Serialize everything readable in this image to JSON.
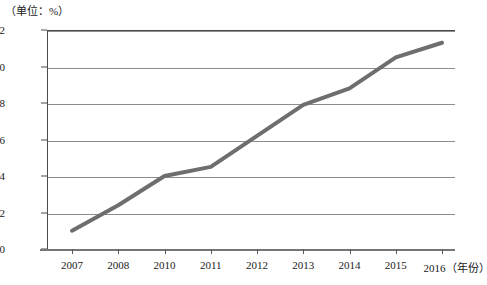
{
  "chart_data": {
    "type": "line",
    "title": "",
    "unit_note": "（单位：%）",
    "xlabel": "（年份）",
    "ylabel": "",
    "categories": [
      "2007",
      "2008",
      "2010",
      "2011",
      "2012",
      "2013",
      "2014",
      "2015",
      "2016"
    ],
    "values": [
      0.01,
      0.024,
      0.04,
      0.045,
      0.062,
      0.079,
      0.088,
      0.105,
      0.113
    ],
    "series": [
      {
        "name": "",
        "values": [
          0.01,
          0.024,
          0.04,
          0.045,
          0.062,
          0.079,
          0.088,
          0.105,
          0.113
        ]
      }
    ],
    "ylim": [
      0,
      0.12
    ],
    "yticks": [
      "0",
      "0.02",
      "0.04",
      "0.06",
      "0.08",
      "0.10",
      "0.12"
    ],
    "ytick_values": [
      0,
      0.02,
      0.04,
      0.06,
      0.08,
      0.1,
      0.12
    ],
    "grid": true,
    "legend": "none",
    "line_color": "#6e6e6e",
    "grid_color": "#8d8d8d",
    "axis_color": "#4a4a4a"
  },
  "axis": {
    "unit_note": "（单位：%）",
    "x_unit_suffix": "（年份）"
  }
}
